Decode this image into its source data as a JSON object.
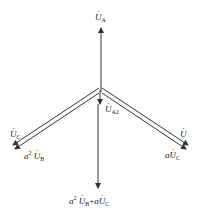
{
  "diagram": {
    "type": "phasor-diagram",
    "colors": {
      "line": "#333333",
      "background": "#ffffff",
      "text": "#222222"
    },
    "labels": {
      "ua": {
        "base": "U",
        "sub": "A"
      },
      "ua2": {
        "base": "U",
        "sub": "A2"
      },
      "uc_left": {
        "base": "U",
        "sub": "C"
      },
      "a2ub_left": {
        "coef": "a",
        "pow": "2",
        "base": "U",
        "sub": "B"
      },
      "u_right": {
        "base": "U"
      },
      "auc_right": {
        "coef": "a",
        "base": "U",
        "sub": "C"
      },
      "bottom": {
        "coef1": "a",
        "pow": "2",
        "base1": "U",
        "sub1": "B",
        "plus": "+",
        "coef2": "a",
        "base2": "U",
        "sub2": "C"
      }
    }
  }
}
